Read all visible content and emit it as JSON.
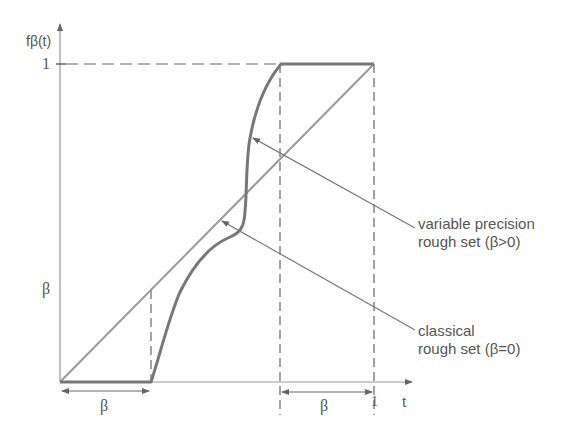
{
  "diagram": {
    "y_axis_label": "fβ(t)",
    "x_axis_label": "t",
    "y_tick_one": "1",
    "y_tick_beta": "β",
    "x_tick_one": "1",
    "left_interval_label": "β",
    "right_interval_label": "β",
    "annotations": [
      {
        "line1": "variable precision",
        "line2": "rough set (β>0)"
      },
      {
        "line1": "classical",
        "line2": "rough set (β=0)"
      }
    ],
    "colors": {
      "axis": "#999999",
      "diagonal": "#9a9a9a",
      "curve": "#777777",
      "dashed": "#666666",
      "text": "#555555"
    }
  }
}
